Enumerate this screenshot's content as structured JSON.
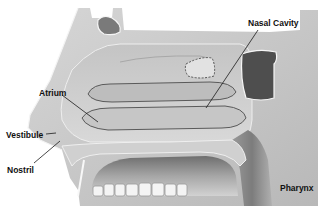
{
  "diagram": {
    "labels": [
      {
        "id": "nasal-cavity",
        "text": "Nasal Cavity",
        "x": 248,
        "y": 19
      },
      {
        "id": "atrium",
        "text": "Atrium",
        "x": 39,
        "y": 89
      },
      {
        "id": "vestibule",
        "text": "Vestibule",
        "x": 6,
        "y": 131
      },
      {
        "id": "nostril",
        "text": "Nostril",
        "x": 7,
        "y": 166
      },
      {
        "id": "pharynx",
        "text": "Pharynx",
        "x": 280,
        "y": 184
      }
    ],
    "colors": {
      "background": "#ffffff",
      "tissue_light": "#d4d4d4",
      "tissue_mid": "#b0b0b0",
      "tissue_dark": "#7a7a7a",
      "sinus_dark": "#4a4a4a",
      "outline": "#f5f5f5",
      "label": "#111111",
      "leader": "#1a1a1a"
    }
  }
}
